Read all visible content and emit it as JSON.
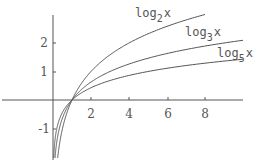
{
  "chart_data": {
    "type": "line",
    "title": "",
    "xlabel": "",
    "ylabel": "",
    "xlim": [
      0,
      10
    ],
    "ylim": [
      -2,
      3
    ],
    "grid": false,
    "legend": "inline labels at curve ends",
    "x_ticks": [
      2,
      4,
      6,
      8
    ],
    "y_ticks": [
      2,
      1,
      -1
    ],
    "x_tick_labels": [
      "2",
      "4",
      "6",
      "8"
    ],
    "y_tick_labels": [
      "2",
      "1",
      "-1"
    ],
    "series": [
      {
        "name": "log_2 x",
        "label_base": "log",
        "label_sub": "2",
        "label_var": "x",
        "base": 2,
        "x_end": 8,
        "points": [
          [
            0.25,
            -2
          ],
          [
            0.5,
            -1
          ],
          [
            1,
            0
          ],
          [
            2,
            1
          ],
          [
            4,
            2
          ],
          [
            8,
            3
          ]
        ]
      },
      {
        "name": "log_3 x",
        "label_base": "log",
        "label_sub": "3",
        "label_var": "x",
        "base": 3,
        "x_end": 10,
        "points": [
          [
            0.111,
            -2
          ],
          [
            0.333,
            -1
          ],
          [
            1,
            0
          ],
          [
            3,
            1
          ],
          [
            9,
            2
          ],
          [
            10,
            2.096
          ]
        ]
      },
      {
        "name": "log_5 x",
        "label_base": "log",
        "label_sub": "5",
        "label_var": "x",
        "base": 5,
        "x_end": 10,
        "points": [
          [
            0.04,
            -2
          ],
          [
            0.2,
            -1
          ],
          [
            1,
            0
          ],
          [
            5,
            1
          ],
          [
            10,
            1.431
          ]
        ]
      }
    ]
  },
  "labels": {
    "log2": {
      "base": "log",
      "sub": "2",
      "var": "x"
    },
    "log3": {
      "base": "log",
      "sub": "3",
      "var": "x"
    },
    "log5": {
      "base": "log",
      "sub": "5",
      "var": "x"
    }
  },
  "ticks": {
    "x": [
      "2",
      "4",
      "6",
      "8"
    ],
    "y": [
      "2",
      "1",
      "-1"
    ]
  }
}
